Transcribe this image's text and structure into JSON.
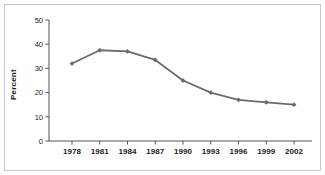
{
  "figure": {
    "border_color": "#c8c8c8",
    "background": "#ffffff"
  },
  "axis": {
    "ylabel": "Percent",
    "axis_color": "#555555",
    "ytick_labels": [
      "0",
      "10",
      "20",
      "30",
      "40",
      "50"
    ],
    "xtick_labels": [
      "1978",
      "1981",
      "1984",
      "1987",
      "1990",
      "1993",
      "1996",
      "1999",
      "2002"
    ]
  },
  "chart_data": {
    "type": "line",
    "title": "",
    "xlabel": "",
    "ylabel": "Percent",
    "categories": [
      "1978",
      "1981",
      "1984",
      "1987",
      "1990",
      "1993",
      "1996",
      "1999",
      "2002"
    ],
    "x": [
      1978,
      1981,
      1984,
      1987,
      1990,
      1993,
      1996,
      1999,
      2002
    ],
    "values": [
      32,
      37.5,
      37,
      33.5,
      25,
      20,
      17,
      16,
      15
    ],
    "series": [
      {
        "name": "Percent",
        "values": [
          32,
          37.5,
          37,
          33.5,
          25,
          20,
          17,
          16,
          15
        ],
        "color": "#6b6b6b",
        "marker": "diamond"
      }
    ],
    "ylim": [
      0,
      50
    ],
    "yticks": [
      0,
      10,
      20,
      30,
      40,
      50
    ],
    "xlim": [
      1978,
      2002
    ],
    "xticks": [
      1978,
      1981,
      1984,
      1987,
      1990,
      1993,
      1996,
      1999,
      2002
    ],
    "grid": false,
    "legend": false,
    "legend_position": "none"
  }
}
